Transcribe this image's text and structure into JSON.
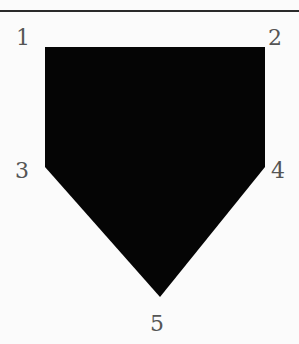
{
  "diagram": {
    "title": "",
    "shape": "home-plate pentagon",
    "fill_color": "#050505",
    "rule_color": "#2a2a2a",
    "label_color": "#555555",
    "vertices": [
      {
        "label": "1",
        "x": 45,
        "y": 47,
        "label_x": 16,
        "label_y": 27
      },
      {
        "label": "2",
        "x": 265,
        "y": 47,
        "label_x": 268,
        "label_y": 27
      },
      {
        "label": "3",
        "x": 45,
        "y": 167,
        "label_x": 15,
        "label_y": 160
      },
      {
        "label": "4",
        "x": 265,
        "y": 167,
        "label_x": 271,
        "label_y": 160
      },
      {
        "label": "5",
        "x": 160,
        "y": 297,
        "label_x": 150,
        "label_y": 313
      }
    ]
  }
}
